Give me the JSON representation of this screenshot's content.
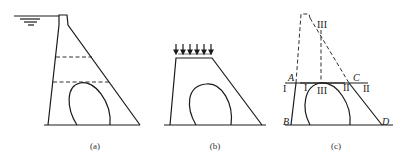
{
  "figure": {
    "panels": [
      {
        "id": "a",
        "caption": "(a)",
        "elements": [
          "water-level-symbol",
          "dam-profile",
          "dashed-horizontal-line-upper",
          "dashed-horizontal-line-lower",
          "stress-ellipse-contour",
          "base-line"
        ]
      },
      {
        "id": "b",
        "caption": "(b)",
        "elements": [
          "distributed-load-arrows",
          "truncated-dam-profile",
          "stress-ellipse-contour",
          "base-line"
        ]
      },
      {
        "id": "c",
        "caption": "(c)",
        "point_labels": {
          "A": "A",
          "B": "B",
          "C": "C",
          "D": "D"
        },
        "section_labels": {
          "I_left": "I",
          "I_inner": "I",
          "II_inner": "II",
          "II_right": "II",
          "III_top": "III",
          "III_bottom": "III"
        }
      }
    ]
  },
  "colors": {
    "stroke": "#1a1a1a",
    "caption": "#333333",
    "background": "#ffffff"
  }
}
